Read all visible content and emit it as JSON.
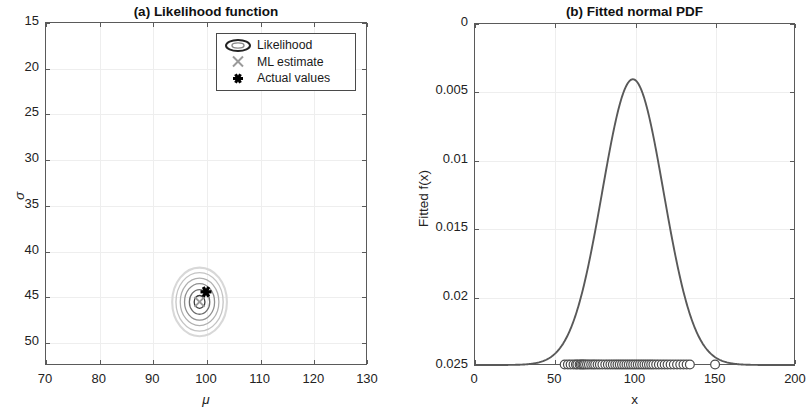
{
  "figure": {
    "width": 812,
    "height": 416,
    "background": "#ffffff",
    "line_color": "#595959",
    "grid_color": "#eeeeee",
    "marker_gray": "#9a9a9a",
    "marker_black": "#000000"
  },
  "panel_a": {
    "title": "(a) Likelihood function",
    "xlabel": "μ",
    "ylabel": "σ",
    "xticks": [
      "70",
      "80",
      "90",
      "100",
      "110",
      "120",
      "130"
    ],
    "yticks": [
      "50",
      "45",
      "40",
      "35",
      "30",
      "25",
      "20",
      "15"
    ],
    "legend": {
      "items": [
        {
          "label": "Likelihood",
          "marker": "contour-ellipse-icon"
        },
        {
          "label": "ML estimate",
          "marker": "cross-x-icon"
        },
        {
          "label": "Actual values",
          "marker": "asterisk-star-icon"
        }
      ]
    }
  },
  "panel_b": {
    "title": "(b) Fitted normal PDF",
    "xlabel": "x",
    "ylabel": "Fitted f(x)",
    "xticks": [
      "0",
      "50",
      "100",
      "150",
      "200"
    ],
    "yticks": [
      "0.025",
      "0.02",
      "0.015",
      "0.01",
      "0.005",
      "0"
    ]
  },
  "chart_data": [
    {
      "type": "contour",
      "panel": "a",
      "title": "(a) Likelihood function",
      "xlabel": "μ",
      "ylabel": "σ",
      "xlim": [
        70,
        130
      ],
      "ylim": [
        12.5,
        50
      ],
      "xticks": [
        70,
        80,
        90,
        100,
        110,
        120,
        130
      ],
      "yticks": [
        15,
        20,
        25,
        30,
        35,
        40,
        45,
        50
      ],
      "grid": true,
      "legend_position": "upper right",
      "legend_entries": [
        "Likelihood",
        "ML estimate",
        "Actual values"
      ],
      "contour_center": {
        "mu": 98.8,
        "sigma": 19.4
      },
      "contour_levels": [
        {
          "level": 1,
          "rx_mu": 1.0,
          "ry_sigma": 0.7
        },
        {
          "level": 2,
          "rx_mu": 1.9,
          "ry_sigma": 1.35
        },
        {
          "level": 3,
          "rx_mu": 2.8,
          "ry_sigma": 2.0
        },
        {
          "level": 4,
          "rx_mu": 3.6,
          "ry_sigma": 2.6
        },
        {
          "level": 5,
          "rx_mu": 4.4,
          "ry_sigma": 3.2
        },
        {
          "level": 6,
          "rx_mu": 5.1,
          "ry_sigma": 3.75
        }
      ],
      "ml_estimate": {
        "mu": 98.8,
        "sigma": 19.4
      },
      "actual_values": {
        "mu": 100.0,
        "sigma": 20.5
      }
    },
    {
      "type": "line",
      "panel": "b",
      "title": "(b) Fitted normal PDF",
      "xlabel": "x",
      "ylabel": "Fitted f(x)",
      "xlim": [
        0,
        200
      ],
      "ylim": [
        0,
        0.025
      ],
      "xticks": [
        0,
        50,
        100,
        150,
        200
      ],
      "yticks": [
        0,
        0.005,
        0.01,
        0.015,
        0.02,
        0.025
      ],
      "grid": true,
      "series": [
        {
          "name": "Fitted normal PDF",
          "distribution": "normal",
          "mu": 99.0,
          "sigma": 19.1,
          "peak_value": 0.0209,
          "peak_x": 99.0
        },
        {
          "name": "Data points",
          "marker": "open-circle",
          "y": 0,
          "values": [
            56.5,
            58.5,
            60.2,
            62.0,
            63.5,
            64.4,
            65.8,
            66.6,
            67.5,
            68.3,
            69.2,
            70.4,
            71.6,
            73.0,
            74.3,
            75.5,
            77.0,
            78.4,
            80.0,
            81.8,
            83.4,
            85.0,
            86.5,
            88.0,
            89.4,
            90.8,
            92.2,
            93.6,
            95.0,
            96.4,
            97.8,
            99.2,
            100.6,
            102.0,
            103.4,
            104.8,
            106.2,
            107.6,
            109.0,
            110.4,
            111.8,
            113.5,
            115.2,
            117.0,
            118.8,
            120.6,
            122.5,
            124.5,
            126.5,
            128.5,
            130.5,
            132.5,
            134.5,
            150.2
          ]
        }
      ]
    }
  ]
}
